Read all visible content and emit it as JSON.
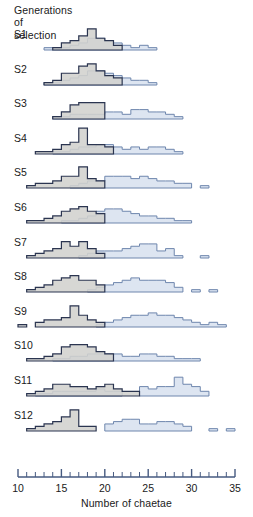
{
  "header": {
    "title_lines": "Generations\nof\nselection"
  },
  "axis": {
    "label": "Number of chaetae",
    "min": 10,
    "max": 35,
    "tick_step": 1,
    "labeled_ticks": [
      10,
      15,
      20,
      25,
      30,
      35
    ],
    "labels": [
      "10",
      "15",
      "20",
      "25",
      "30",
      "35"
    ]
  },
  "colors": {
    "dark_fill": "#d2d2ce",
    "dark_stroke": "#2b3550",
    "light_fill": "#dde5f1",
    "light_stroke": "#6e86ad",
    "axis": "#465a80",
    "text": "#1a1a1a"
  },
  "chart_data": {
    "type": "bar",
    "title": "Generations of selection",
    "xlabel": "Number of chaetae",
    "ylabel": "",
    "xlim": [
      10,
      35
    ],
    "grid": false,
    "legend": "none",
    "rows": [
      {
        "label": "S1",
        "series": [
          {
            "name": "grey",
            "x": [
              14,
              15,
              16,
              17,
              18,
              19,
              20,
              21
            ],
            "values": [
              1,
              3,
              4,
              6,
              9,
              5,
              4,
              2
            ]
          },
          {
            "name": "blue",
            "x": [
              13,
              14,
              15,
              16,
              17,
              18,
              19,
              20,
              21,
              22,
              23,
              24,
              25
            ],
            "values": [
              1,
              1,
              1,
              2,
              3,
              5,
              5,
              4,
              3,
              2,
              1,
              2,
              1
            ]
          }
        ]
      },
      {
        "label": "S2",
        "series": [
          {
            "name": "grey",
            "x": [
              13,
              14,
              15,
              16,
              17,
              18,
              19,
              20,
              21
            ],
            "values": [
              1,
              2,
              5,
              5,
              8,
              9,
              6,
              4,
              3
            ]
          },
          {
            "name": "blue",
            "x": [
              13,
              14,
              15,
              16,
              17,
              18,
              19,
              20,
              21,
              22,
              23,
              24,
              25
            ],
            "values": [
              1,
              1,
              2,
              3,
              4,
              6,
              6,
              5,
              4,
              3,
              2,
              2,
              1
            ]
          }
        ]
      },
      {
        "label": "S3",
        "series": [
          {
            "name": "grey",
            "x": [
              14,
              15,
              16,
              17,
              18,
              19
            ],
            "values": [
              1,
              3,
              6,
              7,
              7,
              7
            ]
          },
          {
            "name": "blue",
            "x": [
              14,
              15,
              16,
              17,
              18,
              19,
              20,
              21,
              22,
              23,
              24,
              25,
              26,
              27,
              28
            ],
            "values": [
              1,
              1,
              2,
              2,
              2,
              2,
              3,
              3,
              2,
              4,
              4,
              3,
              3,
              2,
              1
            ]
          }
        ]
      },
      {
        "label": "S4",
        "series": [
          {
            "name": "grey",
            "x": [
              12,
              13,
              14,
              15,
              16,
              17,
              18,
              19,
              20
            ],
            "values": [
              1,
              1,
              2,
              4,
              5,
              11,
              4,
              4,
              3
            ]
          },
          {
            "name": "blue",
            "x": [
              14,
              15,
              16,
              17,
              18,
              19,
              20,
              21,
              22,
              23,
              24,
              25,
              26,
              27,
              28
            ],
            "values": [
              1,
              1,
              2,
              3,
              3,
              4,
              4,
              3,
              2,
              3,
              2,
              3,
              3,
              2,
              1
            ]
          }
        ]
      },
      {
        "label": "S5",
        "series": [
          {
            "name": "grey",
            "x": [
              11,
              12,
              13,
              14,
              15,
              16,
              17,
              18,
              19
            ],
            "values": [
              1,
              2,
              2,
              3,
              5,
              5,
              9,
              4,
              3
            ]
          },
          {
            "name": "blue",
            "x": [
              16,
              17,
              18,
              19,
              20,
              21,
              22,
              23,
              24,
              25,
              26,
              27,
              28,
              29,
              31
            ],
            "values": [
              1,
              2,
              3,
              3,
              5,
              5,
              5,
              4,
              5,
              4,
              3,
              3,
              2,
              2,
              1
            ]
          }
        ]
      },
      {
        "label": "S6",
        "series": [
          {
            "name": "grey",
            "x": [
              11,
              12,
              13,
              14,
              15,
              16,
              17,
              18,
              19
            ],
            "values": [
              1,
              1,
              2,
              3,
              5,
              6,
              7,
              5,
              4
            ]
          },
          {
            "name": "blue",
            "x": [
              15,
              16,
              17,
              18,
              19,
              20,
              21,
              22,
              23,
              24,
              25,
              26,
              27,
              28,
              29
            ],
            "values": [
              1,
              1,
              2,
              3,
              5,
              6,
              6,
              5,
              4,
              3,
              3,
              2,
              2,
              1,
              1
            ]
          }
        ]
      },
      {
        "label": "S7",
        "series": [
          {
            "name": "grey",
            "x": [
              11,
              12,
              13,
              14,
              15,
              16,
              17,
              18,
              19
            ],
            "values": [
              1,
              2,
              3,
              4,
              7,
              5,
              7,
              4,
              2
            ]
          },
          {
            "name": "blue",
            "x": [
              17,
              18,
              19,
              20,
              21,
              22,
              23,
              24,
              25,
              26,
              27,
              28,
              31
            ],
            "values": [
              1,
              2,
              3,
              3,
              3,
              4,
              5,
              6,
              6,
              3,
              4,
              1,
              1
            ]
          }
        ]
      },
      {
        "label": "S8",
        "series": [
          {
            "name": "grey",
            "x": [
              11,
              12,
              13,
              14,
              15,
              16,
              17,
              18,
              19
            ],
            "values": [
              1,
              2,
              3,
              5,
              6,
              7,
              5,
              5,
              3
            ]
          },
          {
            "name": "blue",
            "x": [
              18,
              19,
              20,
              21,
              22,
              23,
              24,
              25,
              26,
              27,
              28,
              30,
              32
            ],
            "values": [
              1,
              2,
              3,
              4,
              5,
              6,
              5,
              5,
              5,
              4,
              2,
              1,
              1
            ]
          }
        ]
      },
      {
        "label": "S9",
        "series": [
          {
            "name": "grey",
            "x": [
              10,
              12,
              13,
              14,
              15,
              16,
              17,
              18,
              19
            ],
            "values": [
              1,
              2,
              3,
              3,
              4,
              9,
              5,
              3,
              2
            ]
          },
          {
            "name": "blue",
            "x": [
              19,
              20,
              21,
              22,
              23,
              24,
              25,
              26,
              27,
              28,
              29,
              30,
              31,
              32,
              33
            ],
            "values": [
              1,
              2,
              3,
              4,
              5,
              5,
              6,
              5,
              5,
              4,
              3,
              2,
              1,
              2,
              1
            ]
          }
        ]
      },
      {
        "label": "S10",
        "series": [
          {
            "name": "grey",
            "x": [
              11,
              12,
              13,
              14,
              15,
              16,
              17,
              18,
              19,
              20
            ],
            "values": [
              1,
              1,
              2,
              3,
              6,
              7,
              7,
              6,
              4,
              3
            ]
          },
          {
            "name": "blue",
            "x": [
              14,
              15,
              16,
              17,
              18,
              19,
              20,
              21,
              22,
              23,
              24,
              25,
              26,
              27,
              28,
              29,
              30
            ],
            "values": [
              1,
              1,
              2,
              2,
              3,
              3,
              3,
              3,
              2,
              2,
              3,
              3,
              2,
              2,
              1,
              1,
              1
            ]
          }
        ]
      },
      {
        "label": "S11",
        "series": [
          {
            "name": "grey",
            "x": [
              11,
              12,
              13,
              14,
              15,
              16,
              17,
              18,
              19,
              20,
              21,
              22,
              23
            ],
            "values": [
              1,
              2,
              3,
              5,
              5,
              4,
              4,
              3,
              4,
              5,
              3,
              2,
              2
            ]
          },
          {
            "name": "blue",
            "x": [
              12,
              13,
              14,
              15,
              16,
              17,
              18,
              19,
              20,
              21,
              24,
              25,
              26,
              27,
              28,
              29,
              30,
              31
            ],
            "values": [
              1,
              1,
              2,
              2,
              2,
              2,
              2,
              3,
              2,
              2,
              4,
              3,
              4,
              4,
              8,
              5,
              4,
              2
            ]
          }
        ]
      },
      {
        "label": "S12",
        "series": [
          {
            "name": "grey",
            "x": [
              11,
              12,
              13,
              14,
              15,
              16,
              17,
              18
            ],
            "values": [
              1,
              2,
              3,
              4,
              6,
              9,
              2,
              2
            ]
          },
          {
            "name": "blue",
            "x": [
              20,
              21,
              22,
              23,
              24,
              25,
              26,
              27,
              28,
              29,
              32,
              34
            ],
            "values": [
              3,
              4,
              5,
              5,
              3,
              3,
              4,
              4,
              3,
              2,
              1,
              1
            ]
          }
        ]
      }
    ]
  }
}
